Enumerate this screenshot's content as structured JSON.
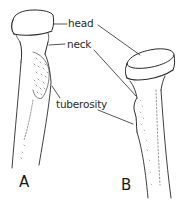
{
  "diagram": {
    "type": "anatomical line drawing",
    "labels": {
      "head": "head",
      "neck": "neck",
      "tuberosity": "tuberosity"
    },
    "figures": {
      "a": "A",
      "b": "B"
    },
    "colors": {
      "ink": "#2a2a2a",
      "background": "#ffffff"
    }
  }
}
